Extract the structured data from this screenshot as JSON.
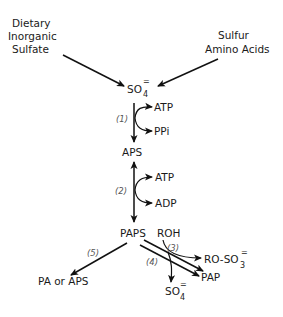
{
  "diagram": {
    "title": "",
    "sources": {
      "dietary": [
        "Dietary",
        "Inorganic",
        "Sulfate"
      ],
      "amino": [
        "Sulfur",
        "Amino Acids"
      ]
    },
    "nodes": {
      "sulfate_top": {
        "base": "SO",
        "sub": "4",
        "sup": "="
      },
      "aps": "APS",
      "paps": "PAPS",
      "pa_or_aps": "PA or APS",
      "pap": "PAP",
      "roh": "ROH",
      "ro_so3": {
        "base": "RO-SO",
        "sub": "3",
        "sup": "="
      },
      "sulfate_bottom": {
        "base": "SO",
        "sub": "4",
        "sup": "="
      }
    },
    "cofactors": {
      "step1_in": "ATP",
      "step1_out": "PPi",
      "step2_in": "ATP",
      "step2_out": "ADP"
    },
    "steps": {
      "s1": "(1)",
      "s2": "(2)",
      "s3": "(3)",
      "s4": "(4)",
      "s5": "(5)"
    },
    "colors": {
      "line": "#111111",
      "text": "#1a1a1a",
      "step_label": "#555555",
      "background": "#ffffff"
    }
  }
}
